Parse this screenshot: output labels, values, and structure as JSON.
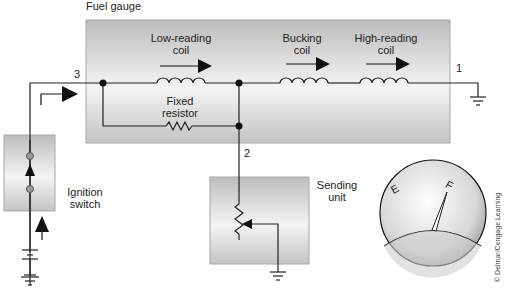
{
  "title": "Fuel gauge",
  "labels": {
    "low_reading_coil": "Low-reading\ncoil",
    "bucking_coil": "Bucking\ncoil",
    "high_reading_coil": "High-reading\ncoil",
    "fixed_resistor": "Fixed\nresistor",
    "ignition_switch": "Ignition\nswitch",
    "sending_unit": "Sending\nunit"
  },
  "terminals": {
    "t1": "1",
    "t2": "2",
    "t3": "3"
  },
  "gauge": {
    "empty_mark": "E",
    "full_mark": "F"
  },
  "credit": "© Delmar/Cengage Learning",
  "colors": {
    "box_fill": "#c8c8c8",
    "box_highlight": "#f2f2f2",
    "wire": "#222222",
    "node": "#111111"
  }
}
